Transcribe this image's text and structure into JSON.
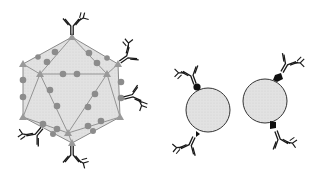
{
  "figure": {
    "panels": [
      {
        "id": "virus-like-particle",
        "description": "Icosahedral particle with surface-displayed epitopes (gray dots) and bound antibodies at vertices",
        "fill_color": "#dcdcdc",
        "edge_color": "#8a8a8a",
        "epitope_color": "#8c8c8c",
        "vertex_color": "#9a9a9a",
        "antibody_count": 7
      },
      {
        "id": "sphere-particle-1",
        "description": "Spherical particle with two bound antibodies via black tags",
        "fill_color": "#e6e6e6",
        "tag_color": "#111111",
        "antibody_count": 2
      },
      {
        "id": "sphere-particle-2",
        "description": "Spherical particle with two bound antibodies via black tags",
        "fill_color": "#e6e6e6",
        "tag_color": "#111111",
        "antibody_count": 2
      }
    ],
    "antibody_color": "#1a1a1a"
  }
}
